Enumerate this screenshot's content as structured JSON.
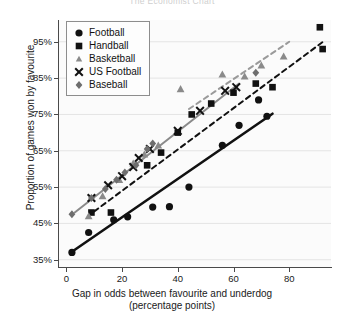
{
  "title": "The Economist  Chart",
  "axes": {
    "ylabel": "Proportion of games won by favourite",
    "xlabel_line1": "Gap in odds between favourite and underdog",
    "xlabel_line2": "(percentage points)",
    "yticks": [
      "35%",
      "45%",
      "55%",
      "65%",
      "75%",
      "85%",
      "95%"
    ],
    "xticks": [
      "0",
      "20",
      "40",
      "60",
      "80"
    ]
  },
  "legend": {
    "items": [
      {
        "label": "Football",
        "marker": "circle",
        "color": "#111111"
      },
      {
        "label": "Handball",
        "marker": "square",
        "color": "#111111"
      },
      {
        "label": "Basketball",
        "marker": "triangle",
        "color": "#8a8a8a"
      },
      {
        "label": "US Football",
        "marker": "cross",
        "color": "#111111"
      },
      {
        "label": "Baseball",
        "marker": "diamond",
        "color": "#6e6e6e"
      }
    ]
  },
  "chart_data": {
    "type": "scatter",
    "title": "The Economist  Chart",
    "xlabel": "Gap in odds between favourite and underdog (percentage points)",
    "ylabel": "Proportion of games won by favourite",
    "xlim": [
      -3,
      95
    ],
    "ylim": [
      33,
      101
    ],
    "grid": true,
    "legend_position": "upper-left",
    "series": [
      {
        "name": "Football",
        "marker": "circle",
        "color": "#111111",
        "points": [
          [
            2,
            37.0
          ],
          [
            8,
            42.5
          ],
          [
            17,
            46.0
          ],
          [
            22,
            46.8
          ],
          [
            31,
            49.5
          ],
          [
            37,
            49.6
          ],
          [
            44,
            55.0
          ],
          [
            56,
            66.5
          ],
          [
            62,
            72.0
          ],
          [
            69,
            79.0
          ],
          [
            72,
            74.5
          ]
        ],
        "trendline": {
          "style": "solid",
          "color": "#111111",
          "x0": 2,
          "y0": 37.2,
          "x1": 74,
          "y1": 75.2
        }
      },
      {
        "name": "Handball",
        "marker": "square",
        "color": "#111111",
        "points": [
          [
            9,
            48.0
          ],
          [
            16,
            48.0
          ],
          [
            29,
            61.0
          ],
          [
            34,
            64.5
          ],
          [
            40,
            70.0
          ],
          [
            45,
            75.0
          ],
          [
            52,
            78.0
          ],
          [
            60,
            81.0
          ],
          [
            68,
            83.5
          ],
          [
            74,
            82.5
          ],
          [
            91,
            99.0
          ],
          [
            92,
            93.0
          ]
        ],
        "trendline": {
          "style": "dashed",
          "color": "#111111",
          "x0": 10,
          "y0": 48.3,
          "x1": 93,
          "y1": 95.5
        }
      },
      {
        "name": "Basketball",
        "marker": "triangle",
        "color": "#8a8a8a",
        "points": [
          [
            8,
            47.0
          ],
          [
            13,
            52.5
          ],
          [
            19,
            57.0
          ],
          [
            24,
            61.5
          ],
          [
            28,
            64.0
          ],
          [
            33,
            66.5
          ],
          [
            41,
            82.0
          ],
          [
            56,
            86.0
          ],
          [
            64,
            85.5
          ],
          [
            70,
            88.5
          ],
          [
            78,
            91.0
          ]
        ],
        "trendline": {
          "style": "dashed",
          "color": "#9a9a9a",
          "x0": 44,
          "y0": 76.5,
          "x1": 80,
          "y1": 95.0
        }
      },
      {
        "name": "US Football",
        "marker": "cross",
        "color": "#111111",
        "points": [
          [
            9,
            52.0
          ],
          [
            15,
            55.5
          ],
          [
            20,
            58.0
          ],
          [
            24,
            60.5
          ],
          [
            26,
            63.0
          ],
          [
            30,
            65.5
          ],
          [
            40,
            70.5
          ],
          [
            48,
            76.0
          ],
          [
            57,
            81.5
          ],
          [
            61,
            82.5
          ]
        ],
        "trendline": {
          "style": "solid",
          "color": "#8a8a8a",
          "x0": 3,
          "y0": 48.0,
          "x1": 62,
          "y1": 83.5
        }
      },
      {
        "name": "Baseball",
        "marker": "diamond",
        "color": "#6e6e6e",
        "points": [
          [
            2,
            47.5
          ],
          [
            9,
            52.0
          ],
          [
            14,
            54.5
          ],
          [
            18,
            57.0
          ],
          [
            21,
            59.0
          ],
          [
            25,
            61.0
          ],
          [
            29,
            65.5
          ],
          [
            31,
            67.0
          ],
          [
            68,
            86.5
          ]
        ]
      }
    ]
  }
}
